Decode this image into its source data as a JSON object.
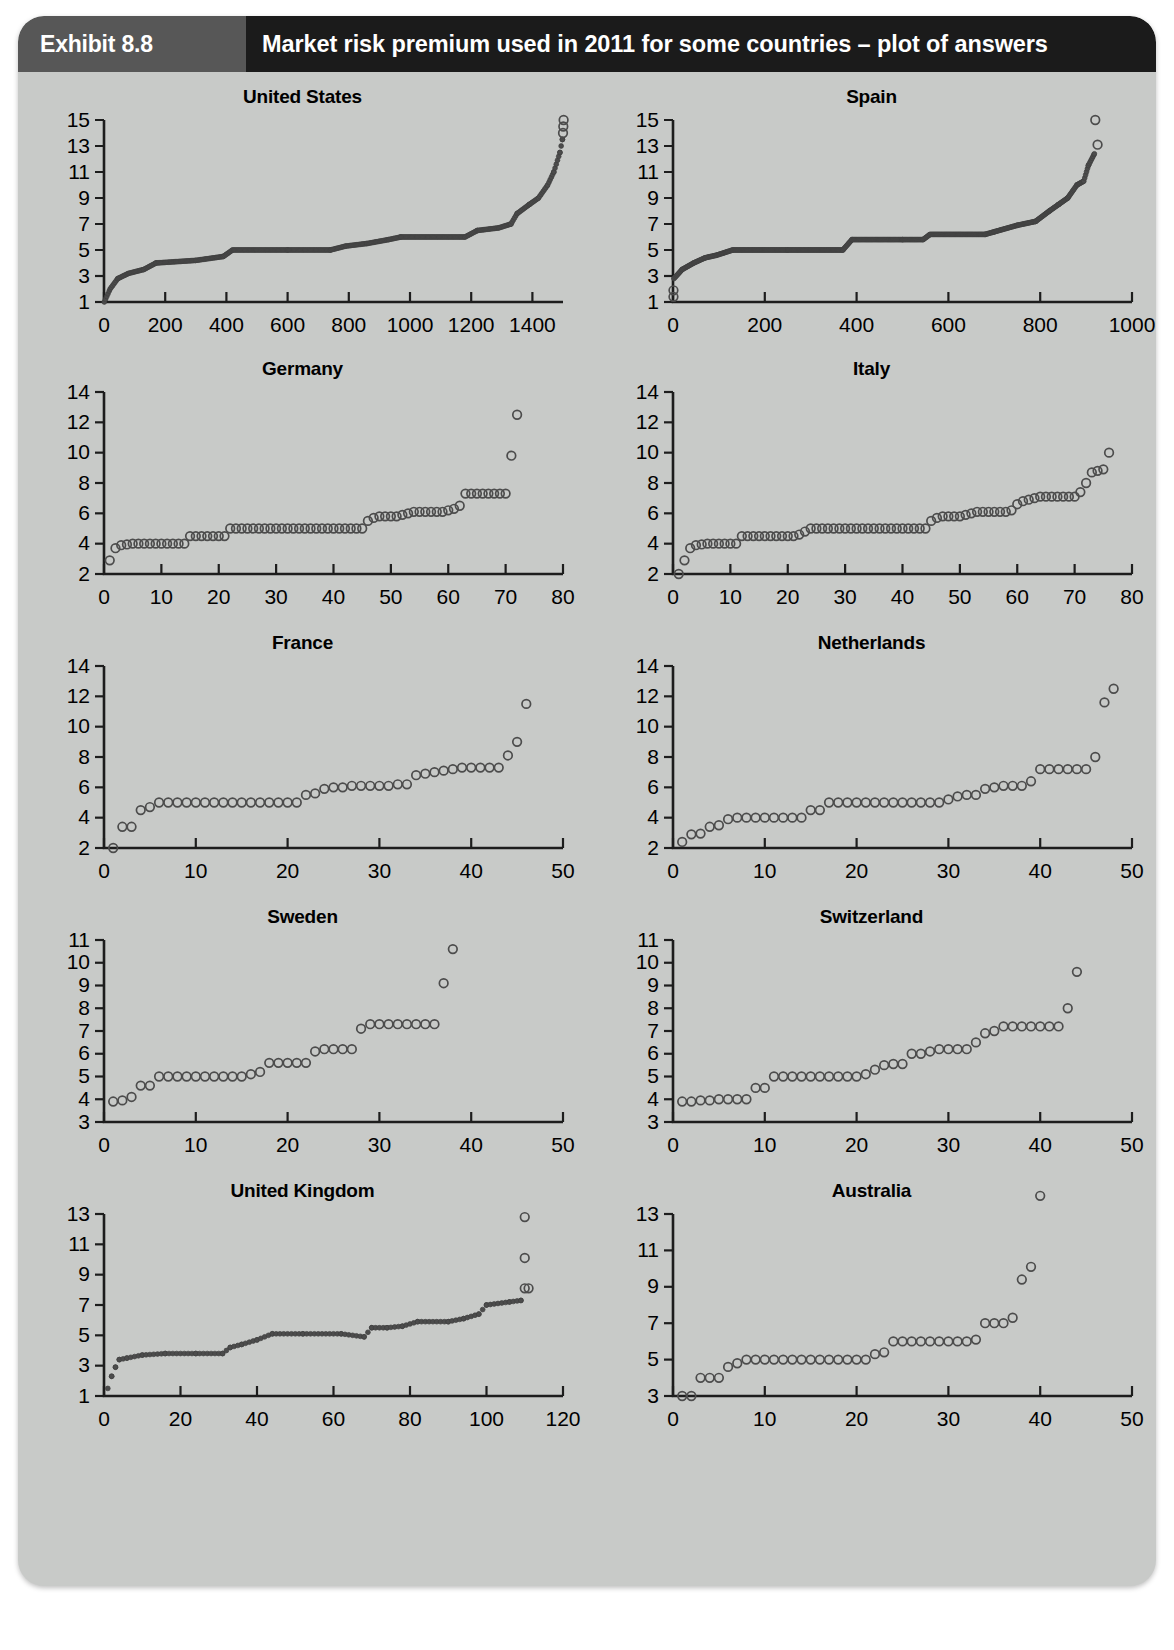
{
  "header": {
    "badge_label": "Exhibit 8.8",
    "title": "Market risk premium used in 2011 for some countries – plot of answers",
    "badge_color": "#575757",
    "title_bar_color": "#1b1b1b",
    "page_background": "#c8cac8"
  },
  "chart_data": [
    {
      "type": "scatter",
      "title": "United States",
      "xlabel": "",
      "ylabel": "",
      "xlim": [
        0,
        1500
      ],
      "ylim": [
        1,
        15
      ],
      "xticks": [
        0,
        200,
        400,
        600,
        800,
        1000,
        1200,
        1400
      ],
      "yticks": [
        1,
        3,
        5,
        7,
        9,
        11,
        13,
        15
      ],
      "grid": false,
      "n_answers": 1503,
      "marker": "dense-filled-band",
      "description": "Sorted market risk premium answers rising from 1.0 to 13.5 with three outliers near 14.5-15",
      "anchor_points": [
        {
          "x": 1,
          "y": 1.0
        },
        {
          "x": 20,
          "y": 2.0
        },
        {
          "x": 45,
          "y": 2.8
        },
        {
          "x": 80,
          "y": 3.2
        },
        {
          "x": 130,
          "y": 3.5
        },
        {
          "x": 170,
          "y": 4.0
        },
        {
          "x": 300,
          "y": 4.2
        },
        {
          "x": 390,
          "y": 4.5
        },
        {
          "x": 420,
          "y": 5.0
        },
        {
          "x": 600,
          "y": 5.0
        },
        {
          "x": 740,
          "y": 5.0
        },
        {
          "x": 790,
          "y": 5.3
        },
        {
          "x": 860,
          "y": 5.5
        },
        {
          "x": 930,
          "y": 5.8
        },
        {
          "x": 970,
          "y": 6.0
        },
        {
          "x": 1180,
          "y": 6.0
        },
        {
          "x": 1220,
          "y": 6.5
        },
        {
          "x": 1290,
          "y": 6.7
        },
        {
          "x": 1330,
          "y": 7.0
        },
        {
          "x": 1350,
          "y": 7.8
        },
        {
          "x": 1390,
          "y": 8.5
        },
        {
          "x": 1420,
          "y": 9.0
        },
        {
          "x": 1450,
          "y": 10.0
        },
        {
          "x": 1470,
          "y": 11.0
        },
        {
          "x": 1490,
          "y": 12.5
        },
        {
          "x": 1498,
          "y": 13.5
        }
      ],
      "outliers": [
        {
          "x": 1500,
          "y": 14.0
        },
        {
          "x": 1501,
          "y": 14.5
        },
        {
          "x": 1502,
          "y": 15.0
        }
      ]
    },
    {
      "type": "scatter",
      "title": "Spain",
      "xlabel": "",
      "ylabel": "",
      "xlim": [
        0,
        1000
      ],
      "ylim": [
        1,
        15
      ],
      "xticks": [
        0,
        200,
        400,
        600,
        800,
        1000
      ],
      "yticks": [
        1,
        3,
        5,
        7,
        9,
        11,
        13,
        15
      ],
      "grid": false,
      "n_answers": 930,
      "marker": "dense-filled-band",
      "description": "Sorted answers rising from 2.8 to 12.4 with low outliers near 1.4-2.0 and high outliers at 13.1 and 15.0",
      "anchor_points": [
        {
          "x": 2,
          "y": 2.8
        },
        {
          "x": 20,
          "y": 3.5
        },
        {
          "x": 45,
          "y": 4.0
        },
        {
          "x": 70,
          "y": 4.4
        },
        {
          "x": 95,
          "y": 4.6
        },
        {
          "x": 130,
          "y": 5.0
        },
        {
          "x": 250,
          "y": 5.0
        },
        {
          "x": 370,
          "y": 5.0
        },
        {
          "x": 390,
          "y": 5.8
        },
        {
          "x": 500,
          "y": 5.8
        },
        {
          "x": 545,
          "y": 5.8
        },
        {
          "x": 560,
          "y": 6.2
        },
        {
          "x": 680,
          "y": 6.2
        },
        {
          "x": 700,
          "y": 6.4
        },
        {
          "x": 750,
          "y": 6.9
        },
        {
          "x": 790,
          "y": 7.2
        },
        {
          "x": 820,
          "y": 8.0
        },
        {
          "x": 840,
          "y": 8.5
        },
        {
          "x": 860,
          "y": 9.0
        },
        {
          "x": 880,
          "y": 10.0
        },
        {
          "x": 895,
          "y": 10.3
        },
        {
          "x": 905,
          "y": 11.5
        },
        {
          "x": 918,
          "y": 12.4
        }
      ],
      "outliers": [
        {
          "x": 1,
          "y": 1.9
        },
        {
          "x": 1,
          "y": 1.4
        },
        {
          "x": 925,
          "y": 13.1
        },
        {
          "x": 920,
          "y": 15.0
        }
      ]
    },
    {
      "type": "scatter",
      "title": "Germany",
      "xlabel": "",
      "ylabel": "",
      "xlim": [
        0,
        80
      ],
      "ylim": [
        2,
        14
      ],
      "xticks": [
        0,
        10,
        20,
        30,
        40,
        50,
        60,
        70,
        80
      ],
      "yticks": [
        2,
        4,
        6,
        8,
        10,
        12,
        14
      ],
      "grid": false,
      "n_answers": 72,
      "marker": "open-circle",
      "description": "72 sorted answers from 2.9 to 7.3 with outliers at 9.8 and 12.5",
      "values": [
        2.9,
        3.7,
        3.9,
        3.95,
        4.0,
        4.0,
        4.0,
        4.0,
        4.0,
        4.0,
        4.0,
        4.0,
        4.0,
        4.0,
        4.5,
        4.5,
        4.5,
        4.5,
        4.5,
        4.5,
        4.5,
        5.0,
        5.0,
        5.0,
        5.0,
        5.0,
        5.0,
        5.0,
        5.0,
        5.0,
        5.0,
        5.0,
        5.0,
        5.0,
        5.0,
        5.0,
        5.0,
        5.0,
        5.0,
        5.0,
        5.0,
        5.0,
        5.0,
        5.0,
        5.0,
        5.5,
        5.7,
        5.8,
        5.8,
        5.8,
        5.8,
        5.9,
        6.0,
        6.1,
        6.1,
        6.1,
        6.1,
        6.1,
        6.1,
        6.2,
        6.3,
        6.5,
        7.3,
        7.3,
        7.3,
        7.3,
        7.3,
        7.3,
        7.3,
        7.3,
        9.8,
        12.5
      ]
    },
    {
      "type": "scatter",
      "title": "Italy",
      "xlabel": "",
      "ylabel": "",
      "xlim": [
        0,
        80
      ],
      "ylim": [
        2,
        14
      ],
      "xticks": [
        0,
        10,
        20,
        30,
        40,
        50,
        60,
        70,
        80
      ],
      "yticks": [
        2,
        4,
        6,
        8,
        10,
        12,
        14
      ],
      "grid": false,
      "n_answers": 76,
      "marker": "open-circle",
      "description": "76 sorted answers from 2.0 to 10.0",
      "values": [
        2.0,
        2.9,
        3.7,
        3.9,
        3.95,
        4.0,
        4.0,
        4.0,
        4.0,
        4.0,
        4.0,
        4.5,
        4.5,
        4.5,
        4.5,
        4.5,
        4.5,
        4.5,
        4.5,
        4.5,
        4.5,
        4.6,
        4.8,
        5.0,
        5.0,
        5.0,
        5.0,
        5.0,
        5.0,
        5.0,
        5.0,
        5.0,
        5.0,
        5.0,
        5.0,
        5.0,
        5.0,
        5.0,
        5.0,
        5.0,
        5.0,
        5.0,
        5.0,
        5.0,
        5.5,
        5.7,
        5.8,
        5.8,
        5.8,
        5.8,
        5.9,
        6.0,
        6.1,
        6.1,
        6.1,
        6.1,
        6.1,
        6.1,
        6.2,
        6.6,
        6.8,
        6.9,
        7.0,
        7.1,
        7.1,
        7.1,
        7.1,
        7.1,
        7.1,
        7.1,
        7.4,
        8.0,
        8.7,
        8.8,
        8.9,
        10.0
      ]
    },
    {
      "type": "scatter",
      "title": "France",
      "xlabel": "",
      "ylabel": "",
      "xlim": [
        0,
        50
      ],
      "ylim": [
        2,
        14
      ],
      "xticks": [
        0,
        10,
        20,
        30,
        40,
        50
      ],
      "yticks": [
        2,
        4,
        6,
        8,
        10,
        12,
        14
      ],
      "grid": false,
      "n_answers": 46,
      "marker": "open-circle",
      "description": "46 sorted answers from 2.0 to 11.5",
      "values": [
        2.0,
        3.4,
        3.4,
        4.5,
        4.7,
        5.0,
        5.0,
        5.0,
        5.0,
        5.0,
        5.0,
        5.0,
        5.0,
        5.0,
        5.0,
        5.0,
        5.0,
        5.0,
        5.0,
        5.0,
        5.0,
        5.5,
        5.6,
        5.9,
        6.0,
        6.0,
        6.1,
        6.1,
        6.1,
        6.1,
        6.1,
        6.2,
        6.2,
        6.8,
        6.9,
        7.0,
        7.1,
        7.2,
        7.3,
        7.3,
        7.3,
        7.3,
        7.3,
        8.1,
        9.0,
        11.5
      ]
    },
    {
      "type": "scatter",
      "title": "Netherlands",
      "xlabel": "",
      "ylabel": "",
      "xlim": [
        0,
        50
      ],
      "ylim": [
        2,
        14
      ],
      "xticks": [
        0,
        10,
        20,
        30,
        40,
        50
      ],
      "yticks": [
        2,
        4,
        6,
        8,
        10,
        12,
        14
      ],
      "grid": false,
      "n_answers": 48,
      "marker": "open-circle",
      "description": "48 sorted answers from 2.4 to 12.5",
      "values": [
        2.4,
        2.9,
        2.95,
        3.4,
        3.5,
        3.9,
        4.0,
        4.0,
        4.0,
        4.0,
        4.0,
        4.0,
        4.0,
        4.0,
        4.5,
        4.5,
        5.0,
        5.0,
        5.0,
        5.0,
        5.0,
        5.0,
        5.0,
        5.0,
        5.0,
        5.0,
        5.0,
        5.0,
        5.0,
        5.2,
        5.4,
        5.5,
        5.5,
        5.9,
        6.0,
        6.1,
        6.1,
        6.1,
        6.4,
        7.2,
        7.2,
        7.2,
        7.2,
        7.2,
        7.2,
        8.0,
        11.6,
        12.5
      ]
    },
    {
      "type": "scatter",
      "title": "Sweden",
      "xlabel": "",
      "ylabel": "",
      "xlim": [
        0,
        50
      ],
      "ylim": [
        3,
        11
      ],
      "xticks": [
        0,
        10,
        20,
        30,
        40,
        50
      ],
      "yticks": [
        3,
        4,
        5,
        6,
        7,
        8,
        9,
        10,
        11
      ],
      "grid": false,
      "n_answers": 38,
      "marker": "open-circle",
      "description": "38 sorted answers from 3.9 to 10.6",
      "values": [
        3.9,
        3.95,
        4.1,
        4.6,
        4.6,
        5.0,
        5.0,
        5.0,
        5.0,
        5.0,
        5.0,
        5.0,
        5.0,
        5.0,
        5.0,
        5.1,
        5.2,
        5.6,
        5.6,
        5.6,
        5.6,
        5.6,
        6.1,
        6.2,
        6.2,
        6.2,
        6.2,
        7.1,
        7.3,
        7.3,
        7.3,
        7.3,
        7.3,
        7.3,
        7.3,
        7.3,
        9.1,
        10.6
      ]
    },
    {
      "type": "scatter",
      "title": "Switzerland",
      "xlabel": "",
      "ylabel": "",
      "xlim": [
        0,
        50
      ],
      "ylim": [
        3,
        11
      ],
      "xticks": [
        0,
        10,
        20,
        30,
        40,
        50
      ],
      "yticks": [
        3,
        4,
        5,
        6,
        7,
        8,
        9,
        10,
        11
      ],
      "grid": false,
      "n_answers": 44,
      "marker": "open-circle",
      "description": "44 sorted answers from 3.9 to 9.6",
      "values": [
        3.9,
        3.9,
        3.95,
        3.95,
        4.0,
        4.0,
        4.0,
        4.0,
        4.5,
        4.5,
        5.0,
        5.0,
        5.0,
        5.0,
        5.0,
        5.0,
        5.0,
        5.0,
        5.0,
        5.0,
        5.1,
        5.3,
        5.5,
        5.55,
        5.55,
        6.0,
        6.0,
        6.1,
        6.2,
        6.2,
        6.2,
        6.2,
        6.5,
        6.9,
        7.0,
        7.2,
        7.2,
        7.2,
        7.2,
        7.2,
        7.2,
        7.2,
        8.0,
        9.6
      ]
    },
    {
      "type": "scatter",
      "title": "United Kingdom",
      "xlabel": "",
      "ylabel": "",
      "xlim": [
        0,
        120
      ],
      "ylim": [
        1,
        13
      ],
      "xticks": [
        0,
        20,
        40,
        60,
        80,
        100,
        120
      ],
      "yticks": [
        1,
        3,
        5,
        7,
        9,
        11,
        13
      ],
      "grid": false,
      "n_answers": 110,
      "marker": "dense-open-circle",
      "description": "110 sorted answers rising from 1.5 to 7.3 with outliers at 8.1, 8.1, 10.1 and 12.8",
      "anchor_points": [
        {
          "x": 1,
          "y": 1.5
        },
        {
          "x": 2,
          "y": 2.3
        },
        {
          "x": 3,
          "y": 2.9
        },
        {
          "x": 4,
          "y": 3.4
        },
        {
          "x": 6,
          "y": 3.5
        },
        {
          "x": 10,
          "y": 3.7
        },
        {
          "x": 16,
          "y": 3.8
        },
        {
          "x": 24,
          "y": 3.8
        },
        {
          "x": 31,
          "y": 3.8
        },
        {
          "x": 33,
          "y": 4.2
        },
        {
          "x": 36,
          "y": 4.4
        },
        {
          "x": 40,
          "y": 4.7
        },
        {
          "x": 44,
          "y": 5.1
        },
        {
          "x": 52,
          "y": 5.1
        },
        {
          "x": 62,
          "y": 5.1
        },
        {
          "x": 68,
          "y": 4.9
        },
        {
          "x": 70,
          "y": 5.5
        },
        {
          "x": 74,
          "y": 5.5
        },
        {
          "x": 78,
          "y": 5.6
        },
        {
          "x": 82,
          "y": 5.9
        },
        {
          "x": 90,
          "y": 5.9
        },
        {
          "x": 94,
          "y": 6.1
        },
        {
          "x": 98,
          "y": 6.4
        },
        {
          "x": 100,
          "y": 7.0
        },
        {
          "x": 106,
          "y": 7.2
        },
        {
          "x": 109,
          "y": 7.3
        }
      ],
      "outliers": [
        {
          "x": 110,
          "y": 8.1
        },
        {
          "x": 111,
          "y": 8.1
        },
        {
          "x": 110,
          "y": 10.1
        },
        {
          "x": 110,
          "y": 12.8
        }
      ]
    },
    {
      "type": "scatter",
      "title": "Australia",
      "xlabel": "",
      "ylabel": "",
      "xlim": [
        0,
        50
      ],
      "ylim": [
        3,
        13
      ],
      "yaxis_overflow_top": 14.0,
      "xticks": [
        0,
        10,
        20,
        30,
        40,
        50
      ],
      "yticks": [
        3,
        5,
        7,
        9,
        11,
        13
      ],
      "grid": false,
      "n_answers": 40,
      "marker": "open-circle",
      "description": "40 sorted answers from 3.0 to 14.0",
      "values": [
        3.0,
        3.0,
        4.0,
        4.0,
        4.0,
        4.6,
        4.8,
        5.0,
        5.0,
        5.0,
        5.0,
        5.0,
        5.0,
        5.0,
        5.0,
        5.0,
        5.0,
        5.0,
        5.0,
        5.0,
        5.0,
        5.3,
        5.4,
        6.0,
        6.0,
        6.0,
        6.0,
        6.0,
        6.0,
        6.0,
        6.0,
        6.0,
        6.1,
        7.0,
        7.0,
        7.0,
        7.3,
        9.4,
        10.1,
        14.0
      ]
    }
  ]
}
